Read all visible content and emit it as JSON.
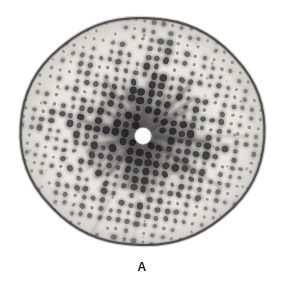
{
  "figure": {
    "panel_label": "A",
    "kind": "x-ray-diffraction-photograph",
    "plate": {
      "left": 13,
      "top": 11,
      "width": 259,
      "height": 241,
      "film_background": "#eceae5",
      "paper_background": "#ffffff",
      "edge_color": "#2e2c2a",
      "corner_radius_px": 46
    },
    "beam_center": {
      "x": 130,
      "y": 125,
      "radius": 8,
      "color": "#ffffff"
    },
    "spot_color": "#16161a",
    "halo_color": "#4a4846",
    "streak_color": "#3a3836"
  },
  "chart_data": {
    "type": "scatter",
    "title": "A",
    "xlabel": "",
    "ylabel": "",
    "grid": false,
    "legend": null,
    "lattice": {
      "a_vector": {
        "dx": 9.2,
        "dy": 1.5
      },
      "b_vector": {
        "dx": -1.6,
        "dy": 8.6
      },
      "origin": {
        "x": 130,
        "y": 125
      },
      "h_range": [
        -15,
        15
      ],
      "k_range": [
        -15,
        15
      ],
      "max_radius": 132,
      "beamstop_radius": 10
    },
    "streaks": {
      "count": 34,
      "inner_radius": 9,
      "outer_radius_min": 26,
      "outer_radius_max": 72
    }
  }
}
